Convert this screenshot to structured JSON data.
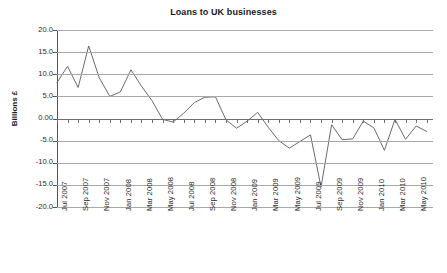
{
  "chart_data": {
    "type": "line",
    "title": "Loans to UK businesses",
    "xlabel": "",
    "ylabel": "Billions £",
    "ylim": [
      -20.0,
      20.0
    ],
    "ytick_labels": [
      "20.0",
      "15.0",
      "10.0",
      "5.0",
      "0.00",
      "-5.0",
      "-10.0",
      "-15.0",
      "-20.0"
    ],
    "ytick_values": [
      20.0,
      15.0,
      10.0,
      5.0,
      0.0,
      -5.0,
      -10.0,
      -15.0,
      -20.0
    ],
    "grid": true,
    "legend": false,
    "legend_position": "none",
    "x_tick_labels": [
      "Jul 2007",
      "Sep 2007",
      "Nov 2007",
      "Jan 2008",
      "Mar 2008",
      "May 2008",
      "Jul 2008",
      "Sep 2008",
      "Nov 2008",
      "Jan 2009",
      "Mar 2009",
      "May 2009",
      "Jul 2009",
      "Sep 2009",
      "Nov 2009",
      "Jan 2010",
      "Mar 2010",
      "May 2010"
    ],
    "x": [
      "Jul 2007",
      "Aug 2007",
      "Sep 2007",
      "Oct 2007",
      "Nov 2007",
      "Dec 2007",
      "Jan 2008",
      "Feb 2008",
      "Mar 2008",
      "Apr 2008",
      "May 2008",
      "Jun 2008",
      "Jul 2008",
      "Aug 2008",
      "Sep 2008",
      "Oct 2008",
      "Nov 2008",
      "Dec 2008",
      "Jan 2009",
      "Feb 2009",
      "Mar 2009",
      "Apr 2009",
      "May 2009",
      "Jun 2009",
      "Jul 2009",
      "Aug 2009",
      "Sep 2009",
      "Oct 2009",
      "Nov 2009",
      "Dec 2009",
      "Jan 2010",
      "Feb 2010",
      "Mar 2010",
      "Apr 2010",
      "May 2010",
      "Jun 2010"
    ],
    "values": [
      8.1,
      11.8,
      7.0,
      16.4,
      9.2,
      5.0,
      6.0,
      11.0,
      7.3,
      4.0,
      -0.2,
      -0.8,
      1.2,
      3.6,
      4.8,
      4.9,
      -0.3,
      -2.2,
      -0.6,
      1.4,
      -2.0,
      -5.0,
      -6.7,
      -5.2,
      -3.7,
      -15.5,
      -1.4,
      -4.8,
      -4.6,
      -0.6,
      -2.1,
      -7.2,
      -0.2,
      -4.7,
      -1.7,
      -2.9
    ],
    "series_color": "#6b6b6b",
    "grid_color": "#a8a8a8",
    "axis_color": "#555555"
  }
}
